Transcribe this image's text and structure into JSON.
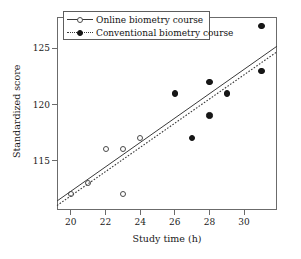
{
  "chart_data": {
    "type": "scatter",
    "title": "",
    "xlabel": "Study time (h)",
    "ylabel": "Standardized score",
    "xlim": [
      19.2,
      31.9
    ],
    "ylim": [
      110.6,
      127.8
    ],
    "xticks": [
      20,
      22,
      24,
      26,
      28,
      30
    ],
    "yticks": [
      115,
      120,
      125
    ],
    "xtick_labels": [
      "20",
      "22",
      "24",
      "26",
      "28",
      "30"
    ],
    "ytick_labels": [
      "115",
      "120",
      "125"
    ],
    "grid": false,
    "legend_position": "top-left-inside",
    "series": [
      {
        "name": "Online biometry course",
        "marker": "open-circle",
        "line_style": "solid",
        "points": [
          {
            "x": 20,
            "y": 112
          },
          {
            "x": 21,
            "y": 113
          },
          {
            "x": 22,
            "y": 116
          },
          {
            "x": 23,
            "y": 112
          },
          {
            "x": 23,
            "y": 116
          },
          {
            "x": 24,
            "y": 117
          }
        ],
        "fit_line": {
          "x1": 19.2,
          "y1": 111.4,
          "x2": 31.9,
          "y2": 125.2
        }
      },
      {
        "name": "Conventional biometry course",
        "marker": "filled-circle",
        "line_style": "dotted",
        "points": [
          {
            "x": 26,
            "y": 121
          },
          {
            "x": 27,
            "y": 117
          },
          {
            "x": 28,
            "y": 122
          },
          {
            "x": 28,
            "y": 119
          },
          {
            "x": 29,
            "y": 121
          },
          {
            "x": 31,
            "y": 127
          },
          {
            "x": 31,
            "y": 123
          }
        ],
        "fit_line": {
          "x1": 19.2,
          "y1": 111.0,
          "x2": 31.9,
          "y2": 124.7
        }
      }
    ]
  },
  "legend": {
    "entries": [
      {
        "label": "Online biometry course",
        "marker": "open-circle",
        "line": "solid"
      },
      {
        "label": "Conventional biometry course",
        "marker": "filled-circle",
        "line": "dotted"
      }
    ]
  },
  "colors": {
    "axis": "#6b6b6b",
    "text": "#1a1a1a",
    "series_online": "#4a4a4a",
    "series_conventional": "#171717",
    "background": "#ffffff"
  }
}
